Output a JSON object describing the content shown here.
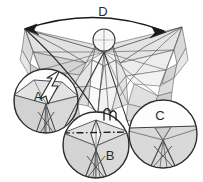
{
  "figure": {
    "background_color": "#ffffff",
    "width": 203,
    "height": 182,
    "palette": {
      "outline_dark": "#3a3a3a",
      "outline_mid": "#6e6e6e",
      "outline_light": "#9a9a9a",
      "fill_light": "#ededed",
      "fill_mid": "#dcdcdc",
      "fill_dark": "#cacaca",
      "fill_white": "#fbfbfb",
      "label_color": "#2b2b2b",
      "annotation_color": "#1f1f1f",
      "highlight_fill": "#ffffff"
    }
  },
  "labels": {
    "callout_a": "A",
    "callout_b": "B",
    "callout_c": "C",
    "dimension_d": "D"
  },
  "callouts": [
    {
      "id": "a",
      "label": "A",
      "center_x": 46,
      "center_y": 101,
      "radius": 32,
      "label_x": 38,
      "label_y": 98,
      "has_pointer": true,
      "pointer_kind": "white-lightning-arrow"
    },
    {
      "id": "b",
      "label": "B",
      "center_x": 96,
      "center_y": 145,
      "radius": 33,
      "label_x": 110,
      "label_y": 157,
      "has_pointer": true,
      "pointer_kind": "dash-dot-axis"
    },
    {
      "id": "c",
      "label": "C",
      "center_x": 163,
      "center_y": 134,
      "radius": 34,
      "label_x": 160,
      "label_y": 117,
      "has_pointer": false,
      "pointer_kind": "none"
    }
  ],
  "annotations": {
    "dimension_arc": {
      "label": "D",
      "label_x": 103,
      "label_y": 13,
      "start_x": 25,
      "start_y": 29,
      "end_x": 166,
      "end_y": 32,
      "arrowheads": "both-ends",
      "style": "curved-span-arrow"
    },
    "axis_line": {
      "style": "dash-dot",
      "start_x": 63,
      "start_y": 133,
      "end_x": 131,
      "end_y": 132
    },
    "squiggle_marker": {
      "x": 110,
      "y": 114,
      "shape": "m-wave"
    },
    "lightning_pointer": {
      "tip_x": 45,
      "tip_y": 104,
      "tail_x": 60,
      "tail_y": 70,
      "shape": "zigzag-arrow"
    }
  }
}
